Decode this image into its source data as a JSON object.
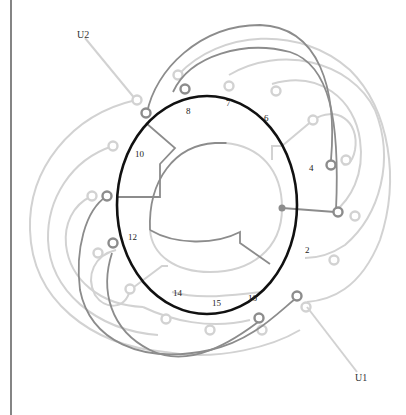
{
  "diagram": {
    "type": "stator-winding-diagram",
    "terminals": [
      {
        "id": "U2",
        "label": "U2",
        "x": 48,
        "y": 36
      },
      {
        "id": "U1",
        "label": "U1",
        "x": 355,
        "y": 386
      }
    ],
    "slot_labels": [
      {
        "label": "8",
        "x": 190,
        "y": 115
      },
      {
        "label": "7",
        "x": 229,
        "y": 108
      },
      {
        "label": "6",
        "x": 268,
        "y": 119
      },
      {
        "label": "4",
        "x": 311,
        "y": 170
      },
      {
        "label": "10",
        "x": 140,
        "y": 157
      },
      {
        "label": "12",
        "x": 132,
        "y": 240
      },
      {
        "label": "2",
        "x": 308,
        "y": 252
      },
      {
        "label": "14",
        "x": 177,
        "y": 296
      },
      {
        "label": "15",
        "x": 216,
        "y": 306
      },
      {
        "label": "16",
        "x": 253,
        "y": 301
      }
    ],
    "colors": {
      "ring": "#111111",
      "dark_wire": "#8a8a8a",
      "light_wire": "#cfcfcf",
      "border": "#333333"
    }
  }
}
